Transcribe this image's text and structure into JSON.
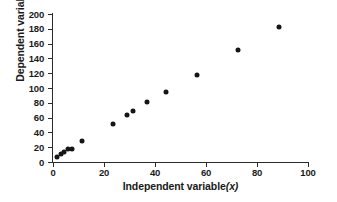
{
  "chart_data": {
    "type": "scatter",
    "title": "",
    "xlabel": "Independent variable (x)",
    "xlabel_text": "Independent variable",
    "xlabel_symbol": "(x)",
    "ylabel": "Dependent variable (y)",
    "ylabel_text": "Dependent variable",
    "ylabel_symbol": "(y)",
    "xlim": [
      0,
      100
    ],
    "ylim": [
      0,
      200
    ],
    "xticks": [
      0,
      20,
      40,
      60,
      80,
      100
    ],
    "yticks": [
      0,
      20,
      40,
      60,
      80,
      100,
      120,
      140,
      160,
      180,
      200
    ],
    "grid": false,
    "legend": false,
    "marker": "filled-diamond",
    "marker_color": "#161616",
    "points": [
      {
        "x": 1.5,
        "y": 7
      },
      {
        "x": 3.0,
        "y": 11
      },
      {
        "x": 4.5,
        "y": 14
      },
      {
        "x": 6.0,
        "y": 17
      },
      {
        "x": 7.5,
        "y": 18
      },
      {
        "x": 11.5,
        "y": 28
      },
      {
        "x": 23.5,
        "y": 52
      },
      {
        "x": 29.0,
        "y": 64
      },
      {
        "x": 31.5,
        "y": 69
      },
      {
        "x": 37.0,
        "y": 81
      },
      {
        "x": 44.5,
        "y": 95
      },
      {
        "x": 56.5,
        "y": 118
      },
      {
        "x": 72.5,
        "y": 152
      },
      {
        "x": 88.5,
        "y": 183
      }
    ]
  },
  "axes": {
    "axis_color": "#2b2b2b",
    "background": "#ffffff"
  }
}
